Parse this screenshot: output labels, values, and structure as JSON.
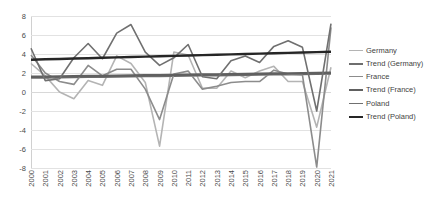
{
  "chart_data": {
    "type": "line",
    "title": "",
    "xlabel": "",
    "ylabel": "",
    "ylim": [
      -8,
      8
    ],
    "yticks": [
      8,
      6,
      4,
      2,
      0,
      -2,
      -4,
      -6,
      -8
    ],
    "grid": true,
    "legend_position": "right",
    "categories": [
      "2000",
      "2001",
      "2002",
      "2003",
      "2004",
      "2005",
      "2006",
      "2007",
      "2008",
      "2009",
      "2010",
      "2011",
      "2012",
      "2013",
      "2014",
      "2015",
      "2016",
      "2017",
      "2018",
      "2019",
      "2020",
      "2021"
    ],
    "series": [
      {
        "name": "Germany",
        "color": "#b4b4b4",
        "values": [
          3.0,
          1.7,
          0.0,
          -0.7,
          1.2,
          0.7,
          3.8,
          3.0,
          1.0,
          -5.7,
          4.2,
          3.9,
          0.4,
          0.4,
          2.2,
          1.5,
          2.2,
          2.7,
          1.1,
          1.1,
          -3.7,
          2.6
        ]
      },
      {
        "name": "Trend (Germany)",
        "color": "#6e6e6e",
        "values": [
          1.5,
          1.52,
          1.54,
          1.56,
          1.58,
          1.6,
          1.62,
          1.64,
          1.66,
          1.68,
          1.7,
          1.72,
          1.74,
          1.76,
          1.78,
          1.8,
          1.82,
          1.84,
          1.86,
          1.88,
          1.9,
          1.92
        ]
      },
      {
        "name": "France",
        "color": "#8c8c8c",
        "values": [
          3.9,
          2.0,
          1.1,
          0.8,
          2.8,
          1.7,
          2.4,
          2.4,
          0.3,
          -2.9,
          1.9,
          2.2,
          0.3,
          0.6,
          1.0,
          1.1,
          1.1,
          2.3,
          1.9,
          1.8,
          -7.9,
          6.8
        ]
      },
      {
        "name": "Trend (France)",
        "color": "#606060",
        "values": [
          1.6,
          1.62,
          1.64,
          1.66,
          1.68,
          1.7,
          1.72,
          1.74,
          1.76,
          1.78,
          1.8,
          1.82,
          1.84,
          1.86,
          1.88,
          1.9,
          1.92,
          1.94,
          1.96,
          1.98,
          2.0,
          2.02
        ]
      },
      {
        "name": "Poland",
        "color": "#707070",
        "values": [
          4.6,
          1.2,
          1.4,
          3.6,
          5.1,
          3.5,
          6.2,
          7.1,
          4.2,
          2.8,
          3.6,
          5.0,
          1.6,
          1.4,
          3.3,
          3.8,
          3.1,
          4.8,
          5.4,
          4.7,
          -2.0,
          7.2
        ]
      },
      {
        "name": "Trend (Poland)",
        "color": "#262626",
        "values": [
          3.4,
          3.44,
          3.48,
          3.52,
          3.56,
          3.6,
          3.64,
          3.68,
          3.72,
          3.76,
          3.8,
          3.84,
          3.88,
          3.92,
          3.96,
          4.0,
          4.04,
          4.08,
          4.12,
          4.16,
          4.2,
          4.24
        ]
      }
    ]
  },
  "legend": {
    "items": [
      {
        "label": "Germany",
        "color": "#b4b4b4",
        "width": 1.6
      },
      {
        "label": "Trend (Germany)",
        "color": "#6e6e6e",
        "width": 2.2
      },
      {
        "label": "France",
        "color": "#8c8c8c",
        "width": 1.6
      },
      {
        "label": "Trend (France)",
        "color": "#606060",
        "width": 2.4
      },
      {
        "label": "Poland",
        "color": "#707070",
        "width": 1.6
      },
      {
        "label": "Trend (Poland)",
        "color": "#262626",
        "width": 2.4
      }
    ]
  }
}
